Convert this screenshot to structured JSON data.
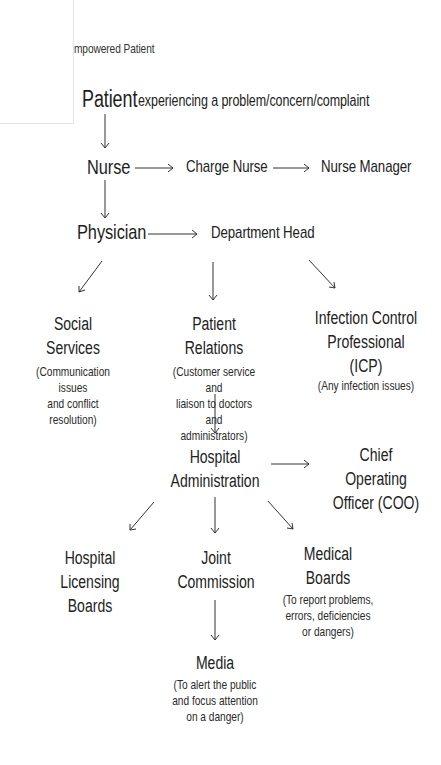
{
  "header": {
    "subtitle": "mpowered Patient"
  },
  "nodes": {
    "patient": {
      "label": "Patient",
      "description": "experiencing a problem/concern/complaint"
    },
    "nurse": {
      "label": "Nurse"
    },
    "charge_nurse": {
      "label": "Charge Nurse"
    },
    "nurse_manager": {
      "label": "Nurse Manager"
    },
    "physician": {
      "label": "Physician"
    },
    "department_head": {
      "label": "Department Head"
    },
    "social_services": {
      "label": "Social Services",
      "note_line1": "(Communication issues",
      "note_line2": "and conflict resolution)"
    },
    "patient_relations": {
      "label": "Patient Relations",
      "note_line1": "(Customer service and",
      "note_line2": "liaison to doctors and",
      "note_line3": "administrators)"
    },
    "icp": {
      "label_line1": "Infection Control",
      "label_line2": "Professional (ICP)",
      "note_line1": "(Any infection issues)"
    },
    "hospital_admin": {
      "label_line1": "Hospital",
      "label_line2": "Administration"
    },
    "coo": {
      "label_line1": "Chief Operating",
      "label_line2": "Officer (COO)"
    },
    "licensing_boards": {
      "label_line1": "Hospital Licensing",
      "label_line2": "Boards"
    },
    "joint_commission": {
      "label_line1": "Joint",
      "label_line2": "Commission"
    },
    "medical_boards": {
      "label_line1": "Medical",
      "label_line2": "Boards",
      "note_line1": "(To report problems,",
      "note_line2": "errors, deficiencies",
      "note_line3": "or dangers)"
    },
    "media": {
      "label": "Media",
      "note_line1": "(To alert the public",
      "note_line2": "and focus attention",
      "note_line3": "on a danger)"
    }
  },
  "edges": [
    [
      "Patient",
      "Nurse"
    ],
    [
      "Nurse",
      "Charge Nurse"
    ],
    [
      "Charge Nurse",
      "Nurse Manager"
    ],
    [
      "Nurse",
      "Physician"
    ],
    [
      "Physician",
      "Department Head"
    ],
    [
      "Department Head",
      "Social Services"
    ],
    [
      "Department Head",
      "Patient Relations"
    ],
    [
      "Department Head",
      "Infection Control Professional (ICP)"
    ],
    [
      "Patient Relations",
      "Hospital Administration"
    ],
    [
      "Hospital Administration",
      "Chief Operating Officer (COO)"
    ],
    [
      "Hospital Administration",
      "Hospital Licensing Boards"
    ],
    [
      "Hospital Administration",
      "Joint Commission"
    ],
    [
      "Hospital Administration",
      "Medical Boards"
    ],
    [
      "Joint Commission",
      "Media"
    ]
  ]
}
